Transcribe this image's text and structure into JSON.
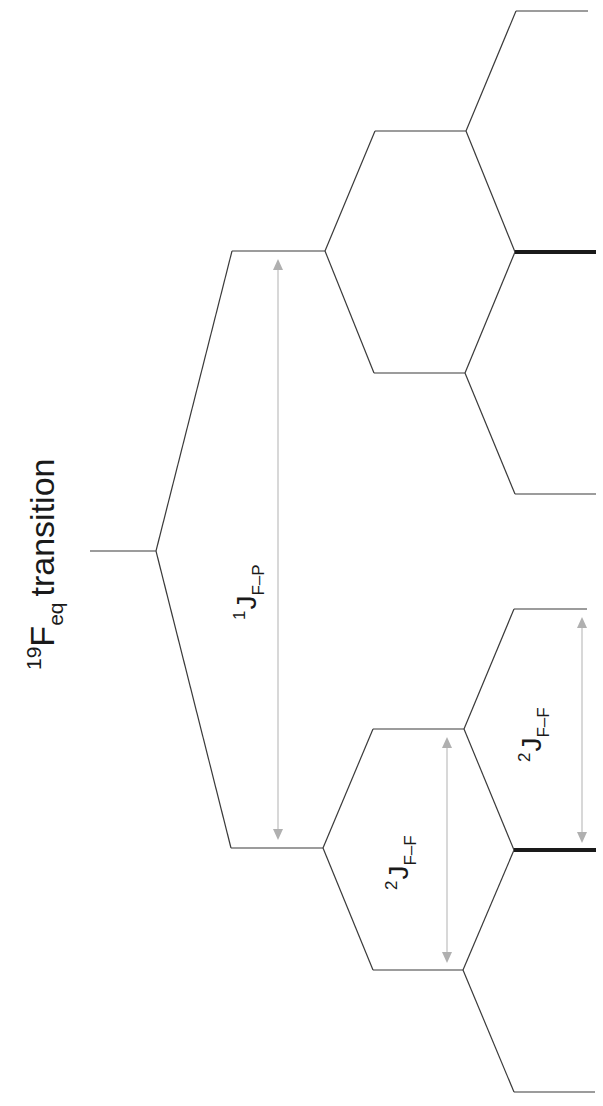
{
  "title": {
    "isotope_mass": "19",
    "element": "F",
    "subscript": "eq",
    "word": "transition"
  },
  "couplings": [
    {
      "id": "J-FP",
      "superscript": "1",
      "symbol": "J",
      "subscript": "F–P"
    },
    {
      "id": "J-FF-a",
      "superscript": "2",
      "symbol": "J",
      "subscript": "F–F"
    },
    {
      "id": "J-FF-b",
      "superscript": "2",
      "symbol": "J",
      "subscript": "F–F"
    }
  ],
  "colors": {
    "line": "#3a3a3a",
    "bold_line": "#1a1a1a",
    "arrow": "#b0b0b0",
    "text": "#1a1a1a"
  },
  "structure": {
    "orientation": "rotated 90 degrees counter-clockwise",
    "tiers": [
      {
        "tier": 0,
        "levels": 1,
        "description": "unsplit 19F equatorial transition"
      },
      {
        "tier": 1,
        "levels": 2,
        "description": "doublet from 1J F-P coupling"
      },
      {
        "tier": 2,
        "levels": 4,
        "description": "each line split into doublet by 2J F-F"
      },
      {
        "tier": 3,
        "levels": 6,
        "description": "triplets per branch; central lines overlapping (bold)"
      }
    ]
  }
}
